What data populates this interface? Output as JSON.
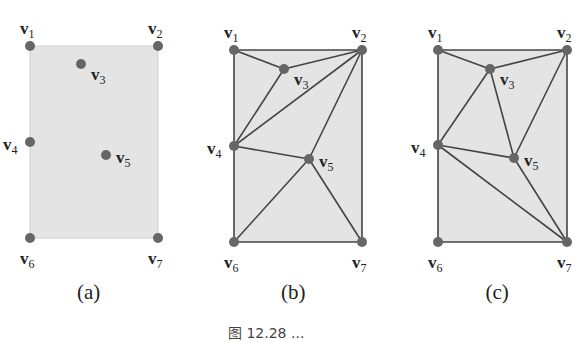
{
  "figure": {
    "caption_partial": "图 12.28 ...",
    "panels": [
      {
        "id": "a",
        "label": "(a)",
        "description": "Point set in rectangle, no triangulation",
        "vertices": [
          {
            "name": "v1",
            "x": 30,
            "y": 46
          },
          {
            "name": "v2",
            "x": 158,
            "y": 46
          },
          {
            "name": "v3",
            "x": 81,
            "y": 64
          },
          {
            "name": "v4",
            "x": 30,
            "y": 142
          },
          {
            "name": "v5",
            "x": 106,
            "y": 155
          },
          {
            "name": "v6",
            "x": 30,
            "y": 238
          },
          {
            "name": "v7",
            "x": 158,
            "y": 238
          }
        ],
        "edges": []
      },
      {
        "id": "b",
        "label": "(b)",
        "description": "Triangulation 1",
        "vertices": [
          {
            "name": "v1",
            "x": 234,
            "y": 50
          },
          {
            "name": "v2",
            "x": 362,
            "y": 50
          },
          {
            "name": "v3",
            "x": 284,
            "y": 69
          },
          {
            "name": "v4",
            "x": 234,
            "y": 146
          },
          {
            "name": "v5",
            "x": 309,
            "y": 159
          },
          {
            "name": "v6",
            "x": 234,
            "y": 242
          },
          {
            "name": "v7",
            "x": 362,
            "y": 242
          }
        ],
        "edges": [
          [
            "v1",
            "v2"
          ],
          [
            "v1",
            "v3"
          ],
          [
            "v3",
            "v2"
          ],
          [
            "v3",
            "v4"
          ],
          [
            "v4",
            "v2"
          ],
          [
            "v2",
            "v5"
          ],
          [
            "v4",
            "v5"
          ],
          [
            "v5",
            "v6"
          ],
          [
            "v5",
            "v7"
          ],
          [
            "v1",
            "v4"
          ],
          [
            "v4",
            "v6"
          ],
          [
            "v6",
            "v7"
          ],
          [
            "v2",
            "v7"
          ]
        ]
      },
      {
        "id": "c",
        "label": "(c)",
        "description": "Triangulation 2",
        "vertices": [
          {
            "name": "v1",
            "x": 438,
            "y": 50
          },
          {
            "name": "v2",
            "x": 567,
            "y": 50
          },
          {
            "name": "v3",
            "x": 490,
            "y": 69
          },
          {
            "name": "v4",
            "x": 438,
            "y": 145
          },
          {
            "name": "v5",
            "x": 514,
            "y": 158
          },
          {
            "name": "v6",
            "x": 438,
            "y": 242
          },
          {
            "name": "v7",
            "x": 567,
            "y": 242
          }
        ],
        "edges": [
          [
            "v1",
            "v2"
          ],
          [
            "v1",
            "v3"
          ],
          [
            "v3",
            "v2"
          ],
          [
            "v3",
            "v4"
          ],
          [
            "v3",
            "v5"
          ],
          [
            "v2",
            "v5"
          ],
          [
            "v4",
            "v5"
          ],
          [
            "v4",
            "v7"
          ],
          [
            "v5",
            "v7"
          ],
          [
            "v1",
            "v4"
          ],
          [
            "v4",
            "v6"
          ],
          [
            "v6",
            "v7"
          ],
          [
            "v2",
            "v7"
          ]
        ]
      }
    ],
    "colors": {
      "fill": "#e4e4e4",
      "edge": "#444444",
      "vertex": "#666666",
      "border_a": "#cfcfcf"
    }
  }
}
